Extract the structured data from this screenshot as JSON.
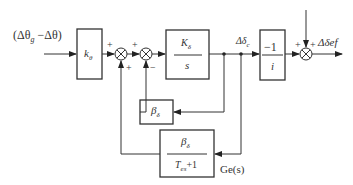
{
  "diagram": {
    "type": "block-diagram",
    "input_label": "(Δθ_g − Δθ)",
    "output_label": "Δδef",
    "blocks": [
      {
        "id": "k_theta",
        "label": "k_θ",
        "numerator": "",
        "denominator": ""
      },
      {
        "id": "integrator",
        "numerator": "K_δ",
        "denominator": "s"
      },
      {
        "id": "beta_feedback",
        "label": "β_δ"
      },
      {
        "id": "gain_neg_inv_i",
        "numerator": "−1",
        "denominator": "i"
      },
      {
        "id": "ge_s",
        "numerator": "β_δ",
        "denominator": "T_es+1",
        "caption": "Ge(s)"
      }
    ],
    "summing_junctions": [
      {
        "id": "sum1",
        "signs": [
          "+",
          "+"
        ]
      },
      {
        "id": "sum2",
        "signs": [
          "+",
          "−"
        ]
      },
      {
        "id": "sum3",
        "signs": [
          "+",
          "+"
        ]
      }
    ],
    "signal_labels": {
      "delta_delta_c": "Δδ_c"
    }
  },
  "text": {
    "input_open": "(Δθ",
    "input_sub": "g",
    "input_close": " −Δθ)",
    "k_main": "k",
    "k_sub": "θ",
    "Kd_main": "K",
    "Kd_sub": "δ",
    "s": "s",
    "beta_main": "β",
    "beta_sub": "δ",
    "minus_one": "−1",
    "i": "i",
    "ge_num_main": "β",
    "ge_num_sub": "δ",
    "ge_den_T": "T",
    "ge_den_sub": "es",
    "ge_den_rest": "+1",
    "ge_caption": "Ge(s)",
    "dd_c_main": "Δδ",
    "dd_c_sub": "c",
    "output": "Δδef",
    "sum1_top": "+",
    "sum1_bottom": "+",
    "sum2_top": "+",
    "sum2_bottom": "−",
    "sum3_left": "+",
    "sum3_top": "+"
  }
}
